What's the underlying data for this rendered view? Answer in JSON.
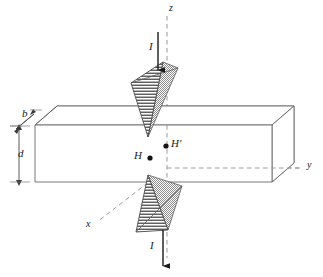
{
  "figure": {
    "background_color": "#ffffff",
    "line_color": "#4a4a4a",
    "dash_color": "#8c8c8c",
    "hatch_color": "#2b2b2b",
    "shade_color": "#a8a8a8",
    "text_color": "#1a1a1a"
  },
  "axes": {
    "z": {
      "label": "z",
      "x": 170,
      "y": 4,
      "orientation": "vertical-up",
      "style": "dashed"
    },
    "y": {
      "label": "y",
      "x": 309,
      "y": 164,
      "orientation": "horizontal-right",
      "style": "dashed"
    },
    "x": {
      "label": "x",
      "x": 88,
      "y": 224,
      "orientation": "diagonal-lower-left",
      "style": "dashed"
    }
  },
  "dimensions": [
    {
      "name": "b",
      "label": "b",
      "x": 22,
      "y": 113,
      "arrow": "double",
      "direction": "diagonal",
      "describes": "beam-width"
    },
    {
      "name": "d",
      "label": "d",
      "x": 18,
      "y": 148,
      "arrow": "double",
      "direction": "vertical",
      "describes": "beam-depth"
    }
  ],
  "points": [
    {
      "name": "H-prime",
      "label": "H′",
      "dot_x": 166,
      "dot_y": 146,
      "label_x": 171,
      "label_y": 140
    },
    {
      "name": "H",
      "label": "H",
      "dot_x": 150,
      "dot_y": 158,
      "label_x": 136,
      "label_y": 152
    }
  ],
  "currents": [
    {
      "name": "current-top",
      "label": "I",
      "label_x": 150,
      "label_y": 46,
      "direction": "down",
      "from_y": 34,
      "to_y": 70,
      "x": 158
    },
    {
      "name": "current-bottom",
      "label": "I",
      "label_x": 150,
      "label_y": 245,
      "direction": "down",
      "from_y": 232,
      "to_y": 268,
      "x": 163
    }
  ],
  "beam": {
    "name": "rectangular-beam",
    "front_top_left": [
      35,
      125
    ],
    "front_top_right": [
      272,
      125
    ],
    "front_bottom_left": [
      35,
      182
    ],
    "front_bottom_right": [
      272,
      182
    ],
    "back_offset": [
      20,
      -18
    ]
  },
  "cones": [
    {
      "name": "cone-upper-indenter",
      "orientation": "apex-down",
      "apex": [
        148,
        137
      ],
      "hatch": "horizontal",
      "shade": "stipple-gray"
    },
    {
      "name": "cone-lower-indenter",
      "orientation": "apex-up",
      "apex": [
        148,
        175
      ],
      "hatch": "horizontal",
      "shade": "stipple-gray"
    }
  ]
}
